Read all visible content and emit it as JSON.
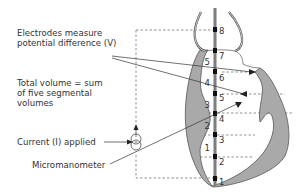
{
  "labels": {
    "electrodes": [
      "Electrodes measure",
      "potential difference (V)"
    ],
    "total_volume": [
      "Total volume = sum",
      "of five segmental",
      "volumes"
    ],
    "current": "Current (I) applied",
    "micromanometer": "Micromanometer"
  },
  "electrode_numbers": [
    "1",
    "2",
    "3",
    "4",
    "5",
    "6",
    "7",
    "8"
  ],
  "segment_numbers": [
    "1",
    "2",
    "3",
    "4",
    "5"
  ],
  "colors": {
    "myocardium": "#a9a9a9",
    "outline": "#555555",
    "text": "#333333",
    "catheter": "#8c8c8c",
    "electrode": "#111111"
  }
}
